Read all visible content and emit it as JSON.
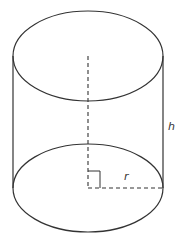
{
  "diagram": {
    "labels": {
      "height": "h",
      "radius": "r"
    },
    "colors": {
      "stroke": "#333333",
      "background": "#ffffff"
    }
  }
}
